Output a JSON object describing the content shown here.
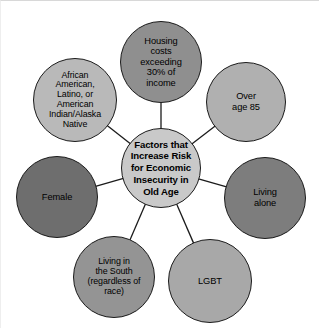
{
  "diagram": {
    "type": "hub-and-spoke",
    "title": "Factors that Increase Risk for Economic Insecurity in Old Age",
    "background_color": "#ffffff",
    "outline_color": "#1b1b1b",
    "connector_color": "#1b1b1b",
    "hub": {
      "id": "hub",
      "label": "Factors that\nIncrease Risk\nfor Economic\nInsecurity in\nOld Age",
      "fill": "#c9c9c9",
      "cx": 160,
      "cy": 167,
      "r": 40
    },
    "nodes": [
      {
        "id": "housing-costs",
        "label": "Housing\ncosts\nexceeding\n30% of\nincome",
        "fill": "#8f8f8f",
        "cx": 160,
        "cy": 61,
        "r": 41,
        "position": "top"
      },
      {
        "id": "race-ethnicity",
        "label": "African\nAmerican,\nLatino, or\nAmerican\nIndian/Alaska\nNative",
        "fill": "#b9b9b9",
        "cx": 74,
        "cy": 99,
        "r": 42,
        "position": "top-left"
      },
      {
        "id": "over-age-85",
        "label": "Over\nage 85",
        "fill": "#b0b0b0",
        "cx": 245,
        "cy": 101,
        "r": 40,
        "position": "top-right"
      },
      {
        "id": "female",
        "label": "Female",
        "fill": "#6e6e6e",
        "cx": 56,
        "cy": 196,
        "r": 41,
        "position": "left"
      },
      {
        "id": "living-alone",
        "label": "Living\nalone",
        "fill": "#7d7d7d",
        "cx": 264,
        "cy": 197,
        "r": 41,
        "position": "right"
      },
      {
        "id": "living-in-south",
        "label": "Living in\nthe South\n(regardless of\nrace)",
        "fill": "#949494",
        "cx": 113,
        "cy": 276,
        "r": 41,
        "position": "bottom-left"
      },
      {
        "id": "lgbt",
        "label": "LGBT",
        "fill": "#a8a8a8",
        "cx": 209,
        "cy": 280,
        "r": 42,
        "position": "bottom-right"
      }
    ],
    "connectors": [
      {
        "from": "hub",
        "to": "housing-costs"
      },
      {
        "from": "hub",
        "to": "race-ethnicity"
      },
      {
        "from": "hub",
        "to": "over-age-85"
      },
      {
        "from": "hub",
        "to": "female"
      },
      {
        "from": "hub",
        "to": "living-alone"
      },
      {
        "from": "hub",
        "to": "living-in-south"
      },
      {
        "from": "hub",
        "to": "lgbt"
      }
    ]
  }
}
